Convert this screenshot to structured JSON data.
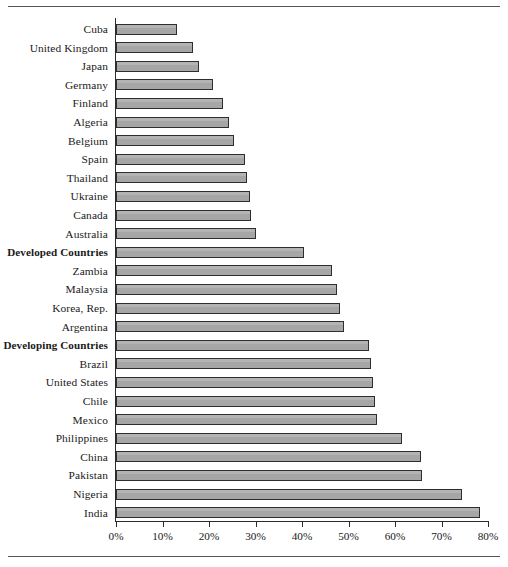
{
  "figure": {
    "name": "horizontal-bar-chart",
    "has_top_rule": true,
    "has_bottom_rule": true,
    "bar_fill_color": "#a6a6a6",
    "bar_border_color": "#2e2e2e",
    "axis_color": "#2b2b2b"
  },
  "chart_data": {
    "type": "bar",
    "orientation": "horizontal",
    "title": "",
    "subtitle": "",
    "xlabel": "",
    "ylabel": "",
    "xlim": [
      0,
      80
    ],
    "grid": false,
    "legend": null,
    "xticks": [
      0,
      10,
      20,
      30,
      40,
      50,
      60,
      70,
      80
    ],
    "xtick_labels": [
      "0%",
      "10%",
      "20%",
      "30%",
      "40%",
      "50%",
      "60%",
      "70%",
      "80%"
    ],
    "value_unit": "%",
    "sorted": "ascending-from-top",
    "categories": [
      "Cuba",
      "United Kingdom",
      "Japan",
      "Germany",
      "Finland",
      "Algeria",
      "Belgium",
      "Spain",
      "Thailand",
      "Ukraine",
      "Canada",
      "Australia",
      "Developed Countries",
      "Zambia",
      "Malaysia",
      "Korea, Rep.",
      "Argentina",
      "Developing Countries",
      "Brazil",
      "United States",
      "Chile",
      "Mexico",
      "Philippines",
      "China",
      "Pakistan",
      "Nigeria",
      "India"
    ],
    "values": [
      13.2,
      16.6,
      17.8,
      20.8,
      23.0,
      24.2,
      25.3,
      27.8,
      28.1,
      28.9,
      29.1,
      30.2,
      40.4,
      46.5,
      47.5,
      48.2,
      49.0,
      54.4,
      54.8,
      55.3,
      55.6,
      56.2,
      61.5,
      65.6,
      65.9,
      74.4,
      78.3
    ],
    "emphasized_categories": [
      "Developed Countries",
      "Developing Countries"
    ]
  }
}
